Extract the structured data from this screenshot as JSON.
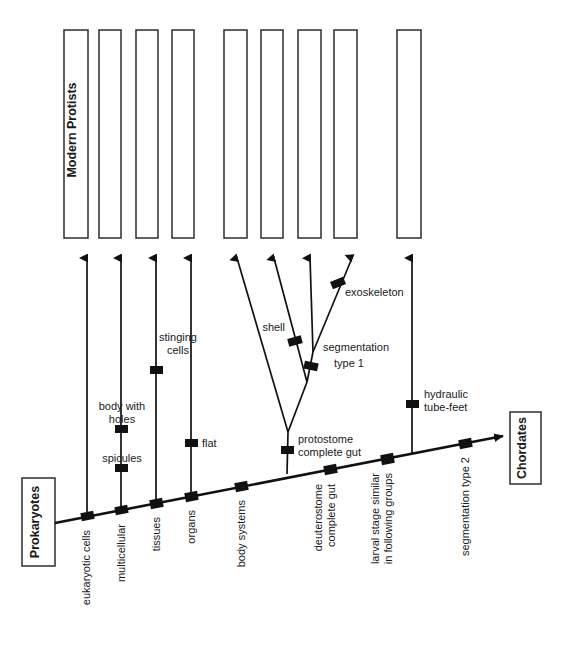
{
  "diagram": {
    "colors": {
      "line": "#111111",
      "box_border": "#3a3a3a",
      "background": "#ffffff",
      "text": "#1a1a1a"
    },
    "root_group": {
      "label": "Prokaryotes"
    },
    "terminal_group": {
      "label": "Chordates"
    },
    "protist_boxes": {
      "count": 9,
      "first_box_label": "Modern Protists",
      "labels": [
        "Modern Protists",
        "",
        "",
        "",
        "",
        "",
        "",
        "",
        ""
      ]
    },
    "trunk_traits": [
      {
        "label": "eukaryotic cells"
      },
      {
        "label": "multicellular"
      },
      {
        "label": "tissues"
      },
      {
        "label": "organs"
      },
      {
        "label": "body systems"
      },
      {
        "label": "deuterostome\ncomplete gut"
      },
      {
        "label": "larval stage similar\nin following groups"
      },
      {
        "label": "segmentation type 2"
      }
    ],
    "trunk_trait_lines": {
      "t0": [
        "eukaryotic cells"
      ],
      "t1": [
        "multicellular"
      ],
      "t2": [
        "tissues"
      ],
      "t3": [
        "organs"
      ],
      "t4": [
        "body systems"
      ],
      "t5": [
        "deuterostome",
        "complete gut"
      ],
      "t6": [
        "larval stage similar",
        "in following groups"
      ],
      "t7": [
        "segmentation type 2"
      ]
    },
    "branch_traits": [
      {
        "label": "body with\nholes",
        "lines": [
          "body with",
          "holes"
        ]
      },
      {
        "label": "spicules",
        "lines": [
          "spicules"
        ]
      },
      {
        "label": "stinging\ncells",
        "lines": [
          "stinging",
          "cells"
        ]
      },
      {
        "label": "flat",
        "lines": [
          "flat"
        ]
      },
      {
        "label": "shell",
        "lines": [
          "shell"
        ]
      },
      {
        "label": "protostome\ncomplete gut",
        "lines": [
          "protostome",
          "complete gut"
        ]
      },
      {
        "label": "segmentation\ntype 1",
        "lines": [
          "segmentation",
          "type 1"
        ]
      },
      {
        "label": "exoskeleton",
        "lines": [
          "exoskeleton"
        ]
      },
      {
        "label": "hydraulic\ntube-feet",
        "lines": [
          "hydraulic",
          "tube-feet"
        ]
      }
    ]
  }
}
